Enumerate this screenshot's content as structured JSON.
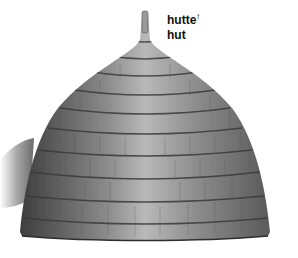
{
  "labels": {
    "french": "hutte",
    "french_gender": "f",
    "english": "hut"
  },
  "illustration": {
    "subject": "thatched-hut",
    "colors": {
      "thatch_light": "#b8b8b8",
      "thatch_mid": "#8a8a8a",
      "thatch_dark": "#4a4a4a",
      "band": "#3a3a3a",
      "background": "#ffffff"
    }
  }
}
